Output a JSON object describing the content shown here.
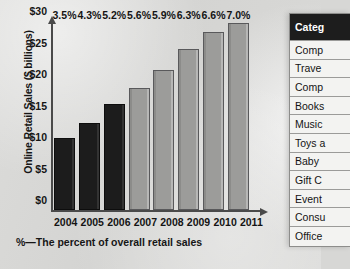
{
  "chart_data": {
    "type": "bar",
    "title": "",
    "xlabel": "",
    "ylabel": "Online Retail Sales ($ billions)",
    "categories": [
      "2004",
      "2005",
      "2006",
      "2007",
      "2008",
      "2009",
      "2010",
      "2011"
    ],
    "values": [
      11.5,
      14.0,
      17.0,
      19.5,
      22.5,
      25.8,
      28.6,
      30.0
    ],
    "data_labels": [
      "3.5%",
      "4.3%",
      "5.2%",
      "5.6%",
      "5.9%",
      "6.3%",
      "6.6%",
      "7.0%"
    ],
    "ylim": [
      0,
      30
    ],
    "yticks": [
      0,
      5,
      10,
      15,
      20,
      25,
      30
    ],
    "ytick_labels": [
      "$0",
      "$5",
      "$10",
      "$15",
      "$20",
      "$25",
      "$30"
    ],
    "grid": false,
    "legend": "none",
    "footnote": "%—The percent of overall retail sales",
    "bar_colors": [
      "#1c1c1c",
      "#1c1c1c",
      "#1c1c1c",
      "#9c9c9a",
      "#9c9c9a",
      "#9c9c9a",
      "#9c9c9a",
      "#9c9c9a"
    ]
  },
  "side_table": {
    "header": "Categ",
    "rows": [
      "Comp",
      "Trave",
      "Comp",
      "Books",
      "Music",
      "Toys a",
      "Baby",
      "Gift C",
      "Event",
      "Consu",
      "Office"
    ]
  }
}
